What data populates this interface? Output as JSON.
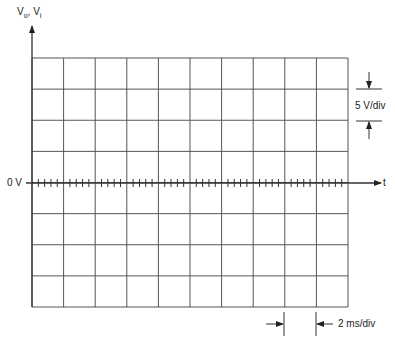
{
  "diagram": {
    "type": "oscilloscope-graticule",
    "y_axis_label": "Vo, Vi",
    "y_axis_label_parts": {
      "main": "V",
      "sub1": "o",
      "sep": ", ",
      "main2": "V",
      "sub2": "i"
    },
    "x_axis_label": "t",
    "zero_label": "0 V",
    "vertical_scale": "5 V/div",
    "horizontal_scale": "2 ms/div",
    "grid": {
      "columns": 10,
      "rows": 8,
      "minor_ticks_per_div": 5
    },
    "colors": {
      "line": "#444444",
      "text": "#222222",
      "background": "#ffffff"
    }
  }
}
